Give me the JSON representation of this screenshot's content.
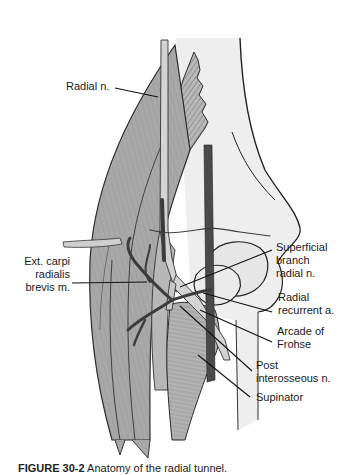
{
  "figure": {
    "kind": "anatomical-illustration",
    "colors": {
      "muscle_fill": "#a9a9a9",
      "muscle_light": "#c4c4c4",
      "nerve_fill": "#d6d6d6",
      "artery_fill": "#4a4a4a",
      "bone_fill": "#eeeeee",
      "outline": "#2b2b2b",
      "leader_line": "#111111"
    },
    "labels": [
      {
        "id": "radial-n",
        "text": "Radial n."
      },
      {
        "id": "ext-carpi",
        "lines": [
          "Ext. carpi",
          "radialis",
          "brevis m."
        ]
      },
      {
        "id": "superficial-branch",
        "lines": [
          "Superficial",
          "branch",
          "radial n."
        ]
      },
      {
        "id": "radial-recurrent",
        "lines": [
          "Radial",
          "recurrent a."
        ]
      },
      {
        "id": "arcade-frohse",
        "lines": [
          "Arcade of",
          "Frohse"
        ]
      },
      {
        "id": "post-interosseous",
        "lines": [
          "Post",
          "interosseous n."
        ]
      },
      {
        "id": "supinator",
        "text": "Supinator"
      }
    ],
    "caption": {
      "prefix": "FIGURE 30-2",
      "text": " Anatomy of the radial tunnel."
    }
  }
}
